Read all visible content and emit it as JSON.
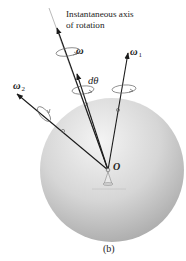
{
  "figure": {
    "caption": "(b)",
    "annotation": {
      "line1": "Instantaneous axis",
      "line2": "of rotation"
    },
    "origin_label": "O",
    "vectors": [
      {
        "id": "omega",
        "label": "ω",
        "subscript": ""
      },
      {
        "id": "dtheta",
        "label": "dθ",
        "subscript": ""
      },
      {
        "id": "omega1",
        "label": "ω",
        "subscript": "1"
      },
      {
        "id": "omega2",
        "label": "ω",
        "subscript": "2"
      }
    ],
    "colors": {
      "sphere_light": "#f2f2f2",
      "sphere_dark": "#a8a8a8",
      "arrow": "#1a1a1a",
      "rotation_ring": "#555555",
      "axis_line": "#777777"
    }
  }
}
